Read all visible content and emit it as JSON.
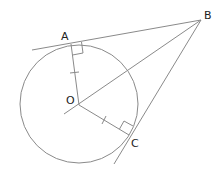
{
  "diagram": {
    "colors": {
      "stroke": "#8a8a8a",
      "label": "#222222",
      "background": "#ffffff"
    },
    "points": {
      "A": {
        "label": "A",
        "x": 71,
        "y": 44
      },
      "B": {
        "label": "B",
        "x": 201,
        "y": 20
      },
      "C": {
        "label": "C",
        "x": 129,
        "y": 135
      },
      "O": {
        "label": "O",
        "x": 79,
        "y": 105
      }
    },
    "circle": {
      "center": "O",
      "radius": 60
    },
    "segments": [
      "BA (tangent, extended)",
      "BC (tangent, extended)",
      "BO (extended)",
      "OA (radius)",
      "OC (radius)"
    ],
    "markers": {
      "right_angles": [
        "OAB",
        "OCB"
      ],
      "equal_ticks": [
        "OA",
        "OC"
      ]
    }
  }
}
